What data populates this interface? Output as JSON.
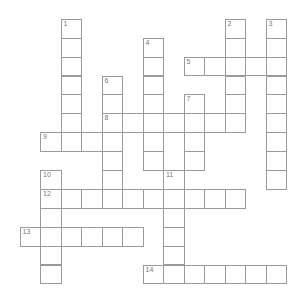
{
  "puzzle": {
    "grid": {
      "origin_x": 20,
      "origin_y": 19.3,
      "cell_w": 20.5,
      "cell_h": 18.9,
      "col_offset": -1,
      "line_color": "#9a9a9a",
      "number_color": "#777777"
    },
    "entries": [
      {
        "number": "1",
        "direction": "down",
        "col": 1,
        "row": 0,
        "length": 7
      },
      {
        "number": "2",
        "direction": "down",
        "col": 9,
        "row": 0,
        "length": 6
      },
      {
        "number": "3",
        "direction": "down",
        "col": 11,
        "row": 0,
        "length": 9
      },
      {
        "number": "4",
        "direction": "down",
        "col": 5,
        "row": 1,
        "length": 7
      },
      {
        "number": "5",
        "direction": "across",
        "col": 7,
        "row": 2,
        "length": 5
      },
      {
        "number": "6",
        "direction": "down",
        "col": 3,
        "row": 3,
        "length": 7
      },
      {
        "number": "7",
        "direction": "down",
        "col": 7,
        "row": 4,
        "length": 4
      },
      {
        "number": "8",
        "direction": "across",
        "col": 3,
        "row": 5,
        "length": 7
      },
      {
        "number": "9",
        "direction": "across",
        "col": 0,
        "row": 6,
        "length": 4
      },
      {
        "number": "10",
        "direction": "down",
        "col": 0,
        "row": 8,
        "length": 6
      },
      {
        "number": "11",
        "direction": "down",
        "col": 6,
        "row": 8,
        "length": 6
      },
      {
        "number": "12",
        "direction": "across",
        "col": 0,
        "row": 9,
        "length": 10
      },
      {
        "number": "13",
        "direction": "across",
        "col": -1,
        "row": 11,
        "length": 6
      },
      {
        "number": "14",
        "direction": "across",
        "col": 5,
        "row": 13,
        "length": 7
      }
    ]
  }
}
